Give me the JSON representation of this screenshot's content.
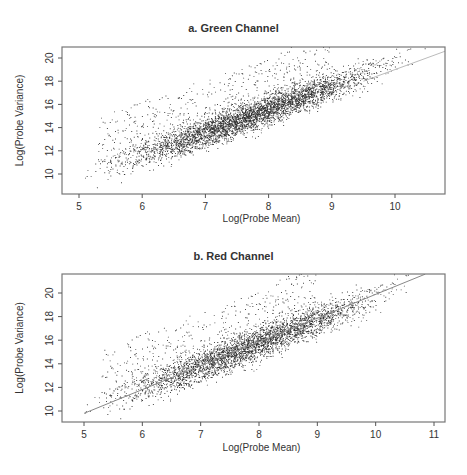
{
  "chart_data": [
    {
      "type": "scatter",
      "title": "a. Green Channel",
      "xlabel": "Log(Probe Mean)",
      "ylabel": "Log(Probe Variance)",
      "xlim": [
        4.75,
        10.8
      ],
      "ylim": [
        8.3,
        21.0
      ],
      "xticks": [
        5,
        6,
        7,
        8,
        9,
        10
      ],
      "yticks": [
        10,
        12,
        14,
        16,
        18,
        20
      ],
      "grid": false,
      "legend": null,
      "trend_line": {
        "x": [
          9.5,
          10.8
        ],
        "y": [
          18.0,
          20.6
        ],
        "color": "#bbbbbb",
        "note": "light fitted line visible at upper right"
      },
      "point_cloud": {
        "approx_points": 9000,
        "description": "Dense positive linear relationship; main band from (5.0, 9.3) to (10.5, 20.2); upper tail of points scattered above band between x=5.5 and 8.8 reaching y≈20.5",
        "main_band": {
          "x_range": [
            4.95,
            10.6
          ],
          "slope": 2.0,
          "intercept": -0.7,
          "spread_sd": 0.6
        },
        "upper_scatter": {
          "x_range": [
            5.3,
            9.0
          ],
          "y_offset_range": [
            0.8,
            5.0
          ],
          "fraction": 0.12
        }
      },
      "point_color": "#111111"
    },
    {
      "type": "scatter",
      "title": "b. Red Channel",
      "xlabel": "Log(Probe Mean)",
      "ylabel": "Log(Probe Variance)",
      "xlim": [
        4.65,
        11.2
      ],
      "ylim": [
        9.1,
        21.6
      ],
      "xticks": [
        5,
        6,
        7,
        8,
        9,
        10,
        11
      ],
      "yticks": [
        10,
        12,
        14,
        16,
        18,
        20
      ],
      "grid": false,
      "legend": null,
      "trend_line": {
        "x": [
          5.0,
          10.85
        ],
        "y": [
          9.8,
          21.6
        ],
        "color": "#888888",
        "note": "fitted regression line across plot"
      },
      "point_cloud": {
        "approx_points": 9000,
        "description": "Dense positive linear relationship; main band from (4.9, 9.7) to (10.9, 20.7); upper scatter between x=5.5 and 8.8 reaching y≈21",
        "main_band": {
          "x_range": [
            4.85,
            10.95
          ],
          "slope": 1.95,
          "intercept": -0.1,
          "spread_sd": 0.65
        },
        "upper_scatter": {
          "x_range": [
            5.3,
            9.0
          ],
          "y_offset_range": [
            0.8,
            5.0
          ],
          "fraction": 0.12
        }
      },
      "point_color": "#111111"
    }
  ],
  "panels": [
    {
      "title": "a. Green Channel",
      "xlabel": "Log(Probe Mean)",
      "ylabel": "Log(Probe Variance)",
      "xtick_labels": [
        "5",
        "6",
        "7",
        "8",
        "9",
        "10"
      ],
      "ytick_labels": [
        "10",
        "12",
        "14",
        "16",
        "18",
        "20"
      ]
    },
    {
      "title": "b. Red Channel",
      "xlabel": "Log(Probe Mean)",
      "ylabel": "Log(Probe Variance)",
      "xtick_labels": [
        "5",
        "6",
        "7",
        "8",
        "9",
        "10",
        "11"
      ],
      "ytick_labels": [
        "10",
        "12",
        "14",
        "16",
        "18",
        "20"
      ]
    }
  ]
}
